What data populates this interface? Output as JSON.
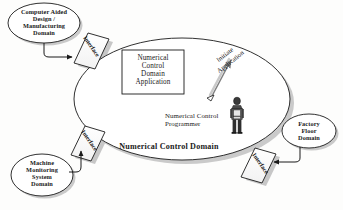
{
  "diagram": {
    "central_domain_label": "Numerical Control Domain",
    "application_box": {
      "name": "numerical-control-domain-application",
      "lines": [
        "Numerical",
        "Control",
        "Domain",
        "Application"
      ],
      "text": "Numerical Control Domain Application"
    },
    "actor": {
      "name": "numerical-control-programmer",
      "lines": [
        "Numerical Control",
        "Programmer"
      ],
      "text": "Numerical Control Programmer",
      "icon": "person-icon"
    },
    "initiate_arrow": {
      "name": "initiate-application-arrow",
      "lines": [
        "Initiate",
        "Application"
      ],
      "text": "Initiate Application"
    },
    "external_domains": [
      {
        "id": "cad-cam-domain",
        "lines": [
          "Computer Aided",
          "Design /",
          "Manufacturing",
          "Domain"
        ],
        "text": "Computer Aided Design / Manufacturing Domain"
      },
      {
        "id": "machine-monitoring-system-domain",
        "lines": [
          "Machine",
          "Monitoring",
          "System",
          "Domain"
        ],
        "text": "Machine Monitoring System Domain"
      },
      {
        "id": "factory-floor-domain",
        "lines": [
          "Factory",
          "Floor",
          "Domain"
        ],
        "text": "Factory Floor Domain"
      }
    ],
    "interfaces": [
      {
        "id": "interface-cad-cam",
        "label": "Interface"
      },
      {
        "id": "interface-machine-monitoring",
        "label": "Interface"
      },
      {
        "id": "interface-factory-floor",
        "label": "Interface"
      },
      {
        "id": "interface-lower-left",
        "label": "Interface"
      }
    ],
    "colors": {
      "stroke": "#1a1a1a",
      "shadow": "#b9b9b9",
      "fill": "#ffffff",
      "background": "#fdfdfc"
    }
  }
}
